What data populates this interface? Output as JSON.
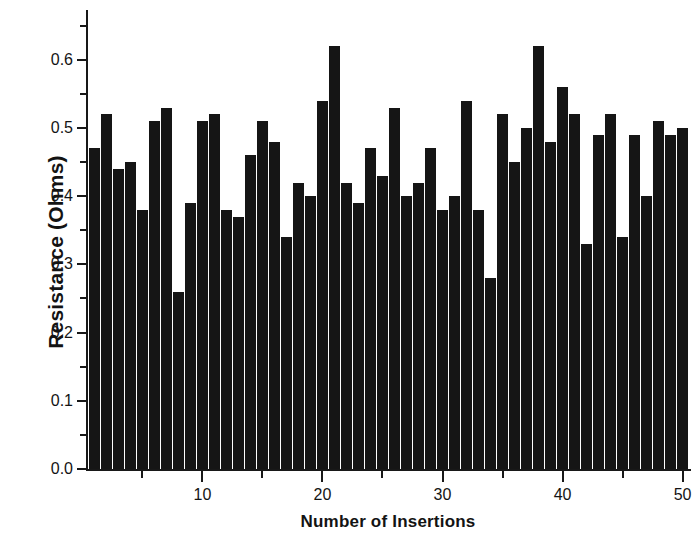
{
  "chart_data": {
    "type": "bar",
    "title": "",
    "subtitle": "",
    "xlabel": "Number of Insertions",
    "ylabel": "Resistance (Ohms)",
    "xlim": [
      0.3,
      50.7
    ],
    "ylim": [
      0.0,
      0.673
    ],
    "grid": false,
    "legend": null,
    "bar_color": "#151515",
    "axis_color": "#181818",
    "background": "#ffffff",
    "x_tick_labels": [
      "10",
      "20",
      "30",
      "40",
      "50"
    ],
    "x_tick_values": [
      10,
      20,
      30,
      40,
      50
    ],
    "x_minor_tick_values": [
      5,
      15,
      25,
      35,
      45
    ],
    "y_tick_labels": [
      "0.0",
      "0.1",
      "0.2",
      "0.3",
      "0.4",
      "0.5",
      "0.6"
    ],
    "y_tick_values": [
      0.0,
      0.1,
      0.2,
      0.3,
      0.4,
      0.5,
      0.6
    ],
    "y_minor_tick_values": [
      0.05,
      0.15,
      0.25,
      0.35,
      0.45,
      0.55,
      0.65
    ],
    "categories": [
      1,
      2,
      3,
      4,
      5,
      6,
      7,
      8,
      9,
      10,
      11,
      12,
      13,
      14,
      15,
      16,
      17,
      18,
      19,
      20,
      21,
      22,
      23,
      24,
      25,
      26,
      27,
      28,
      29,
      30,
      31,
      32,
      33,
      34,
      35,
      36,
      37,
      38,
      39,
      40,
      41,
      42,
      43,
      44,
      45,
      46,
      47,
      48,
      49,
      50
    ],
    "values": [
      0.47,
      0.52,
      0.44,
      0.45,
      0.38,
      0.51,
      0.53,
      0.26,
      0.39,
      0.51,
      0.52,
      0.38,
      0.37,
      0.46,
      0.51,
      0.48,
      0.34,
      0.42,
      0.4,
      0.54,
      0.62,
      0.42,
      0.39,
      0.47,
      0.43,
      0.53,
      0.4,
      0.42,
      0.47,
      0.38,
      0.4,
      0.54,
      0.38,
      0.28,
      0.52,
      0.45,
      0.5,
      0.62,
      0.48,
      0.56,
      0.52,
      0.33,
      0.49,
      0.52,
      0.34,
      0.49,
      0.4,
      0.51,
      0.49,
      0.5
    ],
    "units": "Ohms"
  },
  "axes": {
    "x_title": "Number of Insertions",
    "y_title": "Resistance (Ohms)"
  }
}
